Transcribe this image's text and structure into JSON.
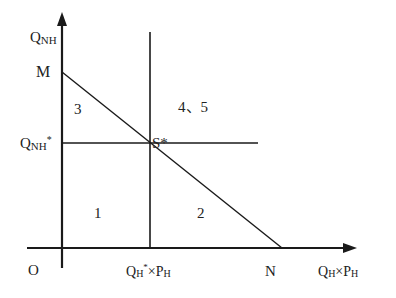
{
  "diagram": {
    "axes": {
      "y_label_main": "Q",
      "y_label_sub": "NH",
      "x_label_main1": "Q",
      "x_label_sub1": "H",
      "x_label_times": "×",
      "x_label_main2": "P",
      "x_label_sub2": "H",
      "origin": "O"
    },
    "points": {
      "M": "M",
      "N": "N",
      "S_star": "S*"
    },
    "tick_labels": {
      "y_tick_main": "Q",
      "y_tick_sub": "NH",
      "y_tick_star": "*",
      "x_tick_main1": "Q",
      "x_tick_sub1": "H",
      "x_tick_star": "*",
      "x_tick_times": "×",
      "x_tick_main2": "P",
      "x_tick_sub2": "H"
    },
    "regions": {
      "r1": "1",
      "r2": "2",
      "r3": "3",
      "r45": "4、5"
    },
    "colors": {
      "line": "#1a1a1a",
      "background": "#ffffff"
    }
  }
}
